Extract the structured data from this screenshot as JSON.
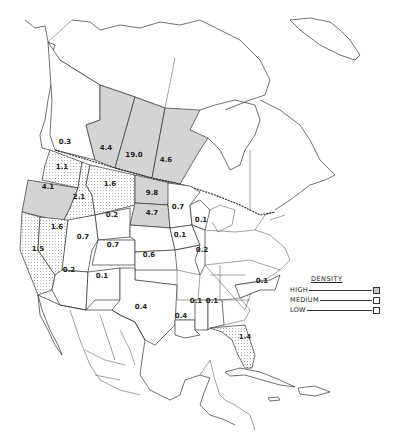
{
  "legend": {
    "title": "DENSITY",
    "items": [
      {
        "label": "HIGH",
        "level": "high"
      },
      {
        "label": "MEDIUM",
        "level": "medium"
      },
      {
        "label": "LOW",
        "level": "low"
      }
    ]
  },
  "colors": {
    "high": "#d4d4d4",
    "medium": "dotted",
    "low": "#ffffff",
    "outline": "#333333"
  },
  "regions": [
    {
      "name": "British Columbia",
      "value": "0.3",
      "level": "low"
    },
    {
      "name": "Alberta",
      "value": "4.4",
      "level": "high"
    },
    {
      "name": "Saskatchewan",
      "value": "19.0",
      "level": "high"
    },
    {
      "name": "Manitoba",
      "value": "4.6",
      "level": "high"
    },
    {
      "name": "Washington",
      "value": "1.1",
      "level": "medium"
    },
    {
      "name": "Oregon",
      "value": "4.1",
      "level": "high"
    },
    {
      "name": "Idaho",
      "value": "2.1",
      "level": "medium"
    },
    {
      "name": "Montana",
      "value": "1.6",
      "level": "medium"
    },
    {
      "name": "North Dakota",
      "value": "9.8",
      "level": "high"
    },
    {
      "name": "South Dakota",
      "value": "4.7",
      "level": "high"
    },
    {
      "name": "Minnesota",
      "value": "0.7",
      "level": "low"
    },
    {
      "name": "Wyoming",
      "value": "0.2",
      "level": "low"
    },
    {
      "name": "Nevada",
      "value": "1.6",
      "level": "medium"
    },
    {
      "name": "California",
      "value": "1.5",
      "level": "medium"
    },
    {
      "name": "Utah",
      "value": "0.7",
      "level": "low"
    },
    {
      "name": "Colorado",
      "value": "0.7",
      "level": "low"
    },
    {
      "name": "Kansas",
      "value": "0.6",
      "level": "low"
    },
    {
      "name": "Iowa",
      "value": "0.1",
      "level": "low"
    },
    {
      "name": "Wisconsin",
      "value": "0.1",
      "level": "low"
    },
    {
      "name": "Illinois",
      "value": "0.2",
      "level": "low"
    },
    {
      "name": "Arizona",
      "value": "0.2",
      "level": "low"
    },
    {
      "name": "New Mexico",
      "value": "0.1",
      "level": "low"
    },
    {
      "name": "Texas",
      "value": "0.4",
      "level": "low"
    },
    {
      "name": "Louisiana",
      "value": "0.4",
      "level": "low"
    },
    {
      "name": "Mississippi",
      "value": "0.1",
      "level": "low"
    },
    {
      "name": "Alabama",
      "value": "0.1",
      "level": "low"
    },
    {
      "name": "North Carolina",
      "value": "0.1",
      "level": "low"
    },
    {
      "name": "Florida",
      "value": "1.4",
      "level": "medium"
    }
  ]
}
